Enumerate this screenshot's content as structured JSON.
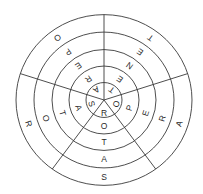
{
  "diagram": {
    "center": [
      104,
      100
    ],
    "radii": [
      18,
      35,
      52,
      70,
      88
    ],
    "y_scale": 0.97,
    "divider_angles_deg": [
      0,
      72,
      144,
      216,
      288
    ],
    "stroke_color": "#3a3a3a",
    "text_color": "#2a2a2a",
    "sectors": [
      {
        "name": "TENET",
        "angle_deg": 36,
        "letters": [
          "T",
          "E",
          "N",
          "E",
          "T"
        ]
      },
      {
        "name": "OPERA",
        "angle_deg": 108,
        "letters": [
          "O",
          "P",
          "E",
          "R",
          "A"
        ]
      },
      {
        "name": "ROTAS",
        "angle_deg": 180,
        "letters": [
          "R",
          "O",
          "T",
          "A",
          "S"
        ]
      },
      {
        "name": "SATOR",
        "angle_deg": 252,
        "letters": [
          "S",
          "A",
          "T",
          "O",
          "R"
        ]
      },
      {
        "name": "AREPO",
        "angle_deg": 324,
        "letters": [
          "A",
          "R",
          "E",
          "P",
          "O"
        ]
      }
    ]
  }
}
